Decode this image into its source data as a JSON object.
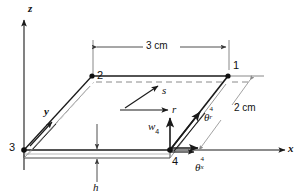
{
  "figure": {
    "type": "engineering-diagram",
    "axes": {
      "z_label": "z",
      "x_label": "x",
      "y_label": "y"
    },
    "local_axes": {
      "r_label": "r",
      "s_label": "s"
    },
    "nodes": [
      {
        "id": "1",
        "label": "1"
      },
      {
        "id": "2",
        "label": "2"
      },
      {
        "id": "3",
        "label": "3"
      },
      {
        "id": "4",
        "label": "4"
      }
    ],
    "dimensions": [
      {
        "name": "length",
        "label": "3 cm"
      },
      {
        "name": "width",
        "label": "2 cm"
      },
      {
        "name": "thickness",
        "label": "h"
      }
    ],
    "dofs": [
      {
        "name": "transverse-displacement",
        "symbol": "w",
        "subscript": "4",
        "superscript": ""
      },
      {
        "name": "rotation-about-r",
        "symbol": "θ",
        "superscript": "4",
        "subscript": "r"
      },
      {
        "name": "rotation-about-x",
        "symbol": "θ",
        "superscript": "4",
        "subscript": "x"
      }
    ],
    "colors": {
      "line": "#1a1a1a",
      "dim_line": "#4a4a4a",
      "dashed": "#8a8a8a",
      "faint": "#9a9a9a",
      "background": "#ffffff"
    }
  }
}
